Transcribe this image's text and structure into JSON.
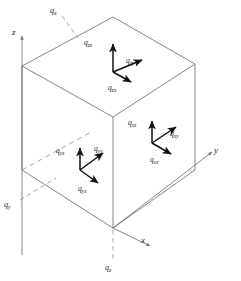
{
  "figure": {
    "background_color": "#ffffff",
    "line_color": "#555555",
    "arrow_color": "#111111",
    "dash_color": "#8a8a8a",
    "text_color": "#1a1a1a",
    "width": 241,
    "height": 281
  },
  "axes": [
    {
      "name": "z-axis",
      "label": "z",
      "direction": "up",
      "x": 14,
      "y": 31
    },
    {
      "name": "y-axis",
      "label": "y",
      "direction": "right-up",
      "x": 215,
      "y": 150
    },
    {
      "name": "x-axis",
      "label": "x",
      "direction": "right-down",
      "x": 141,
      "y": 239
    }
  ],
  "resultant_tractions": [
    {
      "name": "q-x",
      "base": "q",
      "sub": "x",
      "x": 50,
      "y": 9
    },
    {
      "name": "q-y",
      "base": "q",
      "sub": "y",
      "x": 5,
      "y": 203
    },
    {
      "name": "q-z",
      "base": "q",
      "sub": "z",
      "x": 104,
      "y": 266
    }
  ],
  "faces": [
    {
      "name": "top-face-z",
      "components": [
        {
          "name": "q-zz",
          "base": "q",
          "sub": "zz",
          "x": 84,
          "y": 40,
          "direction": "up"
        },
        {
          "name": "q-zy",
          "base": "q",
          "sub": "zy",
          "x": 126,
          "y": 58,
          "direction": "right-up"
        },
        {
          "name": "q-zx",
          "base": "q",
          "sub": "zx",
          "x": 110,
          "y": 84,
          "direction": "right-down"
        }
      ]
    },
    {
      "name": "right-face-x",
      "components": [
        {
          "name": "q-xz",
          "base": "q",
          "sub": "xz",
          "x": 129,
          "y": 120,
          "direction": "up"
        },
        {
          "name": "q-xy",
          "base": "q",
          "sub": "xy",
          "x": 170,
          "y": 132,
          "direction": "right-up"
        },
        {
          "name": "q-xx",
          "base": "q",
          "sub": "xx",
          "x": 152,
          "y": 157,
          "direction": "right-down"
        }
      ]
    },
    {
      "name": "left-face-y",
      "components": [
        {
          "name": "q-yz",
          "base": "q",
          "sub": "yz",
          "x": 58,
          "y": 148,
          "direction": "up"
        },
        {
          "name": "q-yy",
          "base": "q",
          "sub": "yy",
          "x": 93,
          "y": 146,
          "direction": "right-up"
        },
        {
          "name": "q-yx",
          "base": "q",
          "sub": "yx",
          "x": 79,
          "y": 186,
          "direction": "right-down"
        }
      ]
    }
  ]
}
